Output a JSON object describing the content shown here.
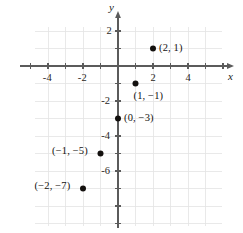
{
  "chart_data": {
    "type": "scatter",
    "title": "",
    "xlabel": "x",
    "ylabel": "y",
    "xlim": [
      -5.5,
      6.1
    ],
    "ylim": [
      -9.3,
      2.9
    ],
    "grid": true,
    "grid_step": 1,
    "legend": "none",
    "x_tick_labels": [
      "-4",
      "-2",
      "2",
      "4"
    ],
    "x_tick_values": [
      -4,
      -2,
      2,
      4
    ],
    "y_tick_labels": [
      "2",
      "-2",
      "-4",
      "-6"
    ],
    "y_tick_values": [
      2,
      -2,
      -4,
      -6
    ],
    "points": [
      {
        "label": "(2, 1)",
        "x": 2,
        "y": 1,
        "label_pos": "right"
      },
      {
        "label": "(1, −1)",
        "x": 1,
        "y": -1,
        "label_pos": "below-right"
      },
      {
        "label": "(0, −3)",
        "x": 0,
        "y": -3,
        "label_pos": "right"
      },
      {
        "label": "(−1, −5)",
        "x": -1,
        "y": -5,
        "label_pos": "left"
      },
      {
        "label": "(−2, −7)",
        "x": -2,
        "y": -7,
        "label_pos": "left"
      }
    ],
    "series": [
      {
        "name": "plotted points",
        "x": [
          2,
          1,
          0,
          -1,
          -2
        ],
        "values": [
          1,
          -1,
          -3,
          -5,
          -7
        ]
      }
    ]
  },
  "style": {
    "background": "#ffffff",
    "grid_color": "#e3e3e3",
    "axis_color": "#5b5b5b",
    "point_color": "#14110f",
    "text_color": "#2b2724"
  },
  "axis_labels": {
    "x": "x",
    "y": "y"
  }
}
